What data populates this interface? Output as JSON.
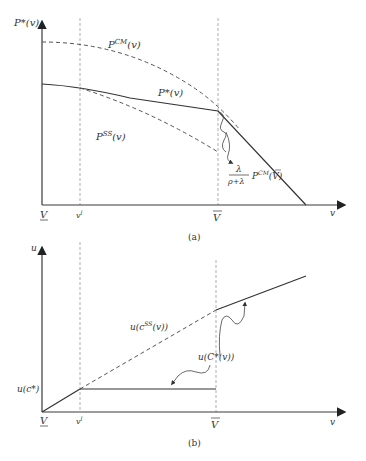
{
  "panel_a": {
    "caption": "(a)",
    "y_axis_label": "P*(v)",
    "x_axis_label": "v",
    "x_ticks": {
      "v_lower": "V",
      "v_l": "v",
      "v_l_sup": "l",
      "v_bar": "V"
    },
    "curves": {
      "p_cm": {
        "name": "P",
        "sup": "CM",
        "arg": "(v)"
      },
      "p_star": {
        "name": "P*(v)"
      },
      "p_ss": {
        "name": "P",
        "sup": "SS",
        "arg": "(v)"
      }
    },
    "annotation": {
      "numerator": "λ",
      "denominator": "ρ+λ",
      "term": "P",
      "term_sup": "CM",
      "term_arg_open": "(",
      "term_arg": "V",
      "term_arg_close": ")"
    }
  },
  "panel_b": {
    "caption": "(b)",
    "y_axis_label": "u",
    "x_axis_label": "v",
    "x_ticks": {
      "v_lower": "V",
      "v_l": "v",
      "v_l_sup": "l",
      "v_bar": "V"
    },
    "y_tick": {
      "label": "u(c*)"
    },
    "curves": {
      "u_css": {
        "pre": "u(c",
        "sup": "SS",
        "post": "(v))"
      },
      "u_cstar": {
        "label": "u(C*(v))"
      }
    }
  },
  "colors": {
    "line": "#3a3a3a",
    "dashed": "#555555",
    "guide": "#9a9a9a",
    "text": "#333333"
  }
}
